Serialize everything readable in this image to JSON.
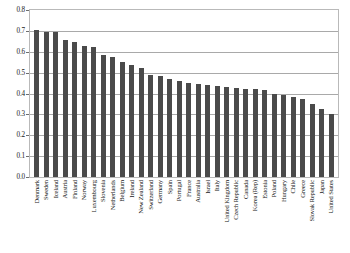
{
  "chart_data": {
    "type": "bar",
    "title": "",
    "subtitle": "",
    "xlabel": "",
    "ylabel": "",
    "ylim": [
      0,
      0.8
    ],
    "ytick_step": 0.1,
    "grid": true,
    "grid_axis": "y",
    "legend": "none",
    "bar_color": "#4a4a4a",
    "background_color": "#ffffff",
    "frame_color": "#b9b9b9",
    "gridline_color": "#a9a9a9",
    "ytick_labels": [
      "0.0",
      "0.1",
      "0.2",
      "0.3",
      "0.4",
      "0.5",
      "0.6",
      "0.7",
      "0.8"
    ],
    "ytick_values": [
      0.0,
      0.1,
      0.2,
      0.3,
      0.4,
      0.5,
      0.6,
      0.7,
      0.8
    ],
    "categories": [
      "Denmark",
      "Sweden",
      "Iceland",
      "Austria",
      "Finland",
      "Norway",
      "Luxembourg",
      "Slovenia",
      "Netherlands",
      "Belgium",
      "Ireland",
      "New Zealand",
      "Switzerland",
      "Germany",
      "Spain",
      "Portugal",
      "France",
      "Australia",
      "Israel",
      "Italy",
      "United Kingdom",
      "Czech Republic",
      "Canada",
      "Korea (Rep)",
      "Estonia",
      "Poland",
      "Hungary",
      "Chile",
      "Greece",
      "Slovak Republic",
      "Japan",
      "United States"
    ],
    "values": [
      0.705,
      0.695,
      0.695,
      0.655,
      0.645,
      0.63,
      0.625,
      0.585,
      0.575,
      0.55,
      0.535,
      0.52,
      0.49,
      0.485,
      0.47,
      0.46,
      0.45,
      0.445,
      0.44,
      0.435,
      0.43,
      0.425,
      0.42,
      0.42,
      0.415,
      0.4,
      0.395,
      0.385,
      0.375,
      0.35,
      0.325,
      0.3
    ]
  }
}
